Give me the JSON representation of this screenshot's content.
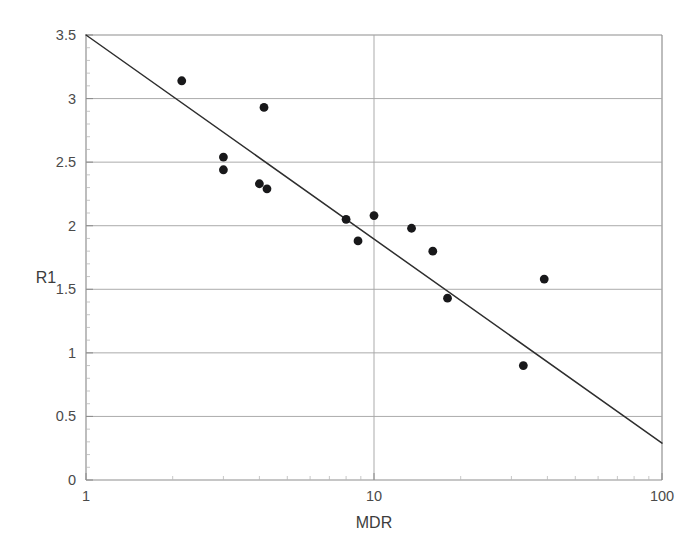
{
  "chart_data": {
    "type": "scatter",
    "title": "",
    "xlabel": "MDR",
    "ylabel": "R1",
    "xscale": "log",
    "yscale": "linear",
    "xlim": [
      1,
      100
    ],
    "ylim": [
      0,
      3.5
    ],
    "grid": true,
    "legend": null,
    "x_ticks": [
      {
        "value": 1,
        "label": "1"
      },
      {
        "value": 10,
        "label": "10"
      },
      {
        "value": 100,
        "label": "100"
      }
    ],
    "y_ticks": [
      {
        "value": 0,
        "label": "0"
      },
      {
        "value": 0.5,
        "label": "0.5"
      },
      {
        "value": 1,
        "label": "1"
      },
      {
        "value": 1.5,
        "label": "1.5"
      },
      {
        "value": 2,
        "label": "2"
      },
      {
        "value": 2.5,
        "label": "2.5"
      },
      {
        "value": 3,
        "label": "3"
      },
      {
        "value": 3.5,
        "label": "3.5"
      }
    ],
    "x_minor_ticks": [
      2,
      3,
      4,
      5,
      6,
      7,
      8,
      9,
      20,
      30,
      40,
      50,
      60,
      70,
      80,
      90
    ],
    "y_minor_ticks": [
      0.1,
      0.2,
      0.3,
      0.4,
      0.6,
      0.7,
      0.8,
      0.9,
      1.1,
      1.2,
      1.3,
      1.4,
      1.6,
      1.7,
      1.8,
      1.9,
      2.1,
      2.2,
      2.3,
      2.4,
      2.6,
      2.7,
      2.8,
      2.9,
      3.1,
      3.2,
      3.3,
      3.4
    ],
    "series": [
      {
        "name": "observations",
        "marker": "filled-circle",
        "color": "#18181a",
        "points": [
          {
            "x": 2.15,
            "y": 3.14
          },
          {
            "x": 3.0,
            "y": 2.54
          },
          {
            "x": 3.0,
            "y": 2.44
          },
          {
            "x": 4.15,
            "y": 2.93
          },
          {
            "x": 4.0,
            "y": 2.33
          },
          {
            "x": 4.25,
            "y": 2.29
          },
          {
            "x": 8.0,
            "y": 2.05
          },
          {
            "x": 8.8,
            "y": 1.88
          },
          {
            "x": 10.0,
            "y": 2.08
          },
          {
            "x": 13.5,
            "y": 1.98
          },
          {
            "x": 16.0,
            "y": 1.8
          },
          {
            "x": 18.0,
            "y": 1.43
          },
          {
            "x": 33.0,
            "y": 0.9
          },
          {
            "x": 39.0,
            "y": 1.58
          }
        ]
      }
    ],
    "trend_line": {
      "name": "fitted regression line",
      "color": "#2e2e2e",
      "x_start": 1.0,
      "y_start": 3.5,
      "x_end": 100.0,
      "y_end": 0.29,
      "equation_note": "linear in log10(MDR)"
    }
  },
  "geometry": {
    "plot_left_px": 86,
    "plot_right_px": 662,
    "plot_top_px": 35,
    "plot_bottom_px": 480
  }
}
